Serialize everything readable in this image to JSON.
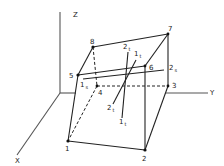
{
  "figure": {
    "axes": {
      "x_label": "X",
      "y_label": "Y",
      "z_label": "Z"
    },
    "vertices": [
      {
        "id": "1",
        "label": "1",
        "x": 68,
        "y": 141
      },
      {
        "id": "2",
        "label": "2",
        "x": 145,
        "y": 150
      },
      {
        "id": "3",
        "label": "3",
        "x": 168,
        "y": 86
      },
      {
        "id": "4",
        "label": "4",
        "x": 97,
        "y": 86
      },
      {
        "id": "5",
        "label": "5",
        "x": 78,
        "y": 75
      },
      {
        "id": "6",
        "label": "6",
        "x": 145,
        "y": 66
      },
      {
        "id": "7",
        "label": "7",
        "x": 168,
        "y": 34
      },
      {
        "id": "8",
        "label": "8",
        "x": 93,
        "y": 47
      }
    ],
    "segment_labels": {
      "top_2t": {
        "main": "2",
        "sub": "t"
      },
      "top_1t": {
        "main": "1",
        "sub": "t"
      },
      "left_1s": {
        "main": "1",
        "sub": "s"
      },
      "right_2s": {
        "main": "2",
        "sub": "s"
      },
      "bottom_2t": {
        "main": "2",
        "sub": "t"
      },
      "bottom_1t": {
        "main": "1",
        "sub": "t"
      }
    }
  }
}
